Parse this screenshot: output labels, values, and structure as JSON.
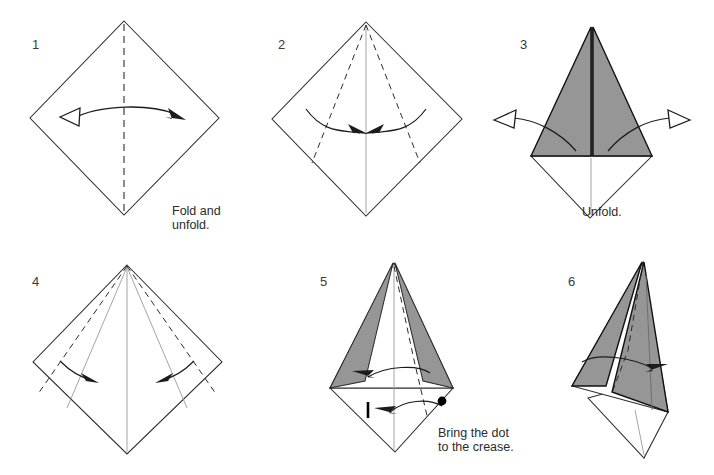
{
  "document": {
    "title": "Origami Folding Instructions",
    "type": "origami-diagram-sequence",
    "page_background": "#ffffff",
    "paper_front_color": "#ffffff",
    "paper_back_color": "#969696",
    "line_color": "#2b2b2b",
    "total_steps": 6
  },
  "steps": [
    {
      "number": "1",
      "caption": "Fold and unfold.",
      "shape": "square rotated 45 degrees (diamond)",
      "creases": [
        "vertical valley fold along center"
      ],
      "arrows": [
        "double-headed fold-and-unfold arrow, hollow head left, solid head right"
      ]
    },
    {
      "number": "2",
      "caption": "",
      "shape": "diamond with vertical center crease",
      "creases": [
        "two valley folds from top vertex to bottom-left and bottom-right edges"
      ],
      "arrows": [
        "curved arrow folding left edge to center",
        "curved arrow folding right edge to center"
      ]
    },
    {
      "number": "3",
      "caption": "Unfold.",
      "shape": "kite with gray back-side triangle on top and white diamond below",
      "creases": [
        "center spine"
      ],
      "arrows": [
        "hollow unfold arrow to the left",
        "hollow unfold arrow to the right"
      ]
    },
    {
      "number": "4",
      "caption": "",
      "shape": "diamond with existing creases from step 2",
      "creases": [
        "two new valley folds from top vertex toward lower side edges"
      ],
      "arrows": [
        "small curved arrow inward on left",
        "small curved arrow inward on right"
      ]
    },
    {
      "number": "5",
      "caption": "Bring the dot\nto the crease.",
      "shape": "kite with two narrow gray flaps and lower white diamond",
      "creases": [
        "dashed valley fold from top vertex down through the body"
      ],
      "markers": [
        "black reference dot on right edge",
        "vertical tick mark on center crease"
      ],
      "arrows": [
        "curved arrow pointing left (upper)",
        "curved arrow pointing left (lower, dot to crease)"
      ]
    },
    {
      "number": "6",
      "caption": "",
      "shape": "tilted kite with large gray flap folded to the right",
      "creases": [
        "dashed crease along folded edge"
      ],
      "arrows": [
        "curved arrow pointing right"
      ]
    }
  ]
}
